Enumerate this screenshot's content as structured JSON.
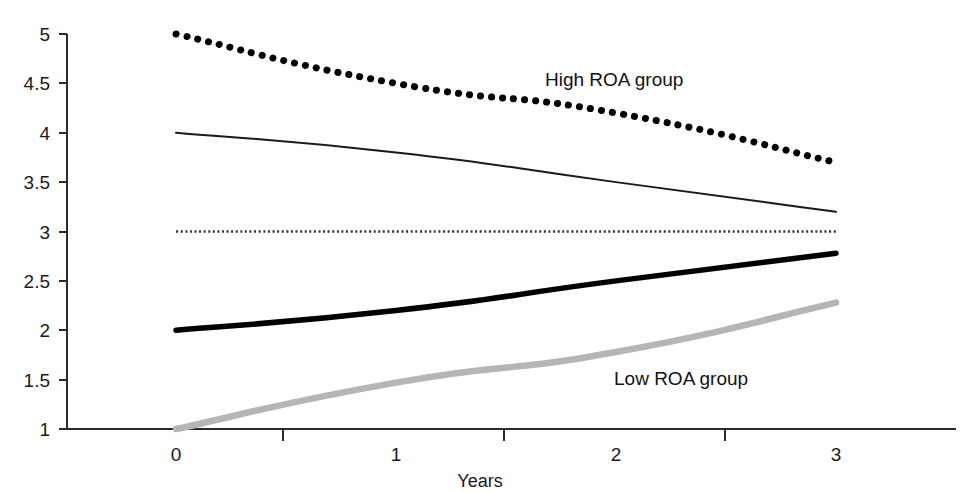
{
  "chart_data": {
    "type": "line",
    "title": "",
    "xlabel": "Years",
    "ylabel": "",
    "x": [
      0,
      1,
      2,
      3
    ],
    "xlim": [
      0,
      3
    ],
    "ylim": [
      1,
      5
    ],
    "xticks": [
      "0",
      "1",
      "2",
      "3"
    ],
    "yticks": [
      "1",
      "1.5",
      "2",
      "2.5",
      "3",
      "3.5",
      "4",
      "4.5",
      "5"
    ],
    "grid": false,
    "legend_position": "inline-annotations",
    "series": [
      {
        "name": "High ROA group",
        "style": "thick-dotted",
        "color": "#000000",
        "values": [
          5.0,
          4.5,
          4.2,
          3.7
        ]
      },
      {
        "name": "Second group",
        "style": "thin-solid",
        "color": "#1a1a1a",
        "values": [
          4.0,
          3.8,
          3.5,
          3.2
        ]
      },
      {
        "name": "Reference level",
        "style": "fine-dotted",
        "color": "#333333",
        "values": [
          3.0,
          3.0,
          3.0,
          3.0
        ]
      },
      {
        "name": "Fourth group",
        "style": "thick-solid",
        "color": "#000000",
        "values": [
          2.0,
          2.2,
          2.5,
          2.78
        ]
      },
      {
        "name": "Low ROA group",
        "style": "thick-gray",
        "color": "#b5b5b5",
        "values": [
          1.0,
          1.47,
          1.78,
          2.28
        ]
      }
    ],
    "annotations": [
      {
        "text": "High ROA group",
        "x_px": 545,
        "y_px": 86
      },
      {
        "text": "Low ROA group",
        "x_px": 614,
        "y_px": 385
      }
    ]
  },
  "axis": {
    "x_title": "Years",
    "y_tick_0": "1",
    "y_tick_1": "1.5",
    "y_tick_2": "2",
    "y_tick_3": "2.5",
    "y_tick_4": "3",
    "y_tick_5": "3.5",
    "y_tick_6": "4",
    "y_tick_7": "4.5",
    "y_tick_8": "5",
    "x_tick_0": "0",
    "x_tick_1": "1",
    "x_tick_2": "2",
    "x_tick_3": "3"
  },
  "labels": {
    "high_roa": "High ROA group",
    "low_roa": "Low ROA group"
  },
  "colors": {
    "axis": "#2b2b2b",
    "ink": "#000000",
    "gray_series": "#b5b5b5",
    "background": "#ffffff"
  }
}
